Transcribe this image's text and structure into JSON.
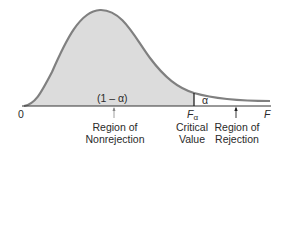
{
  "diagram": {
    "type": "F-distribution critical region",
    "colors": {
      "fill": "#dcdcdc",
      "curve": "#808080",
      "axis": "#333333",
      "text": "#2a2a2a"
    },
    "axis": {
      "origin_label": "0",
      "end_label": "F"
    },
    "critical_value": {
      "symbol": "F",
      "subscript": "α",
      "label_line1": "Critical",
      "label_line2": "Value"
    },
    "areas": {
      "nonrejection_area": "(1 – α)",
      "rejection_area": "α"
    },
    "regions": {
      "nonrejection_line1": "Region of",
      "nonrejection_line2": "Nonrejection",
      "rejection_line1": "Region of",
      "rejection_line2": "Rejection"
    }
  }
}
